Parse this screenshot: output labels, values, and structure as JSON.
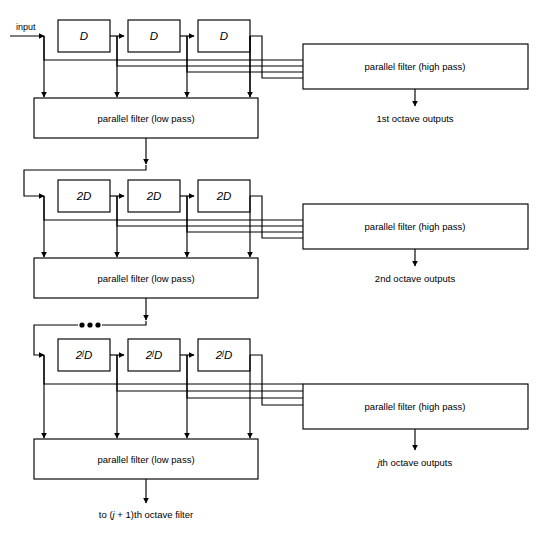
{
  "figure": {
    "type": "block-diagram",
    "input_label": "input",
    "ellipsis": "•••",
    "stroke_color": "#000000",
    "background_color": "#ffffff"
  },
  "stages": [
    {
      "id": "stage-1",
      "delay_label": "D",
      "delay_exponent": "",
      "delay_blocks": [
        "D",
        "D",
        "D"
      ],
      "lowpass_label": "parallel filter (low pass)",
      "highpass_label": "parallel filter (high pass)",
      "output_label": "1st octave outputs",
      "output_label_prefix": "1st",
      "output_label_suffix": " octave outputs",
      "taps": 4
    },
    {
      "id": "stage-2",
      "delay_label": "2D",
      "delay_exponent": "",
      "delay_blocks": [
        "2D",
        "2D",
        "2D"
      ],
      "lowpass_label": "parallel filter (low pass)",
      "highpass_label": "parallel filter (high pass)",
      "output_label": "2nd octave outputs",
      "output_label_prefix": "2nd",
      "output_label_suffix": " octave outputs",
      "taps": 4
    },
    {
      "id": "stage-3",
      "delay_label": "2jD",
      "delay_exponent": "j",
      "delay_blocks": [
        "2jD",
        "2jD",
        "2jD"
      ],
      "lowpass_label": "parallel filter (low pass)",
      "highpass_label": "parallel filter (high pass)",
      "output_label": "jth octave outputs",
      "output_label_prefix": "j",
      "output_label_suffix": "th octave outputs",
      "taps": 4
    }
  ],
  "footer": {
    "text": "to (j + 1)th octave filter",
    "prefix": "to (",
    "italic": "j",
    "suffix": " + 1)th octave filter"
  }
}
